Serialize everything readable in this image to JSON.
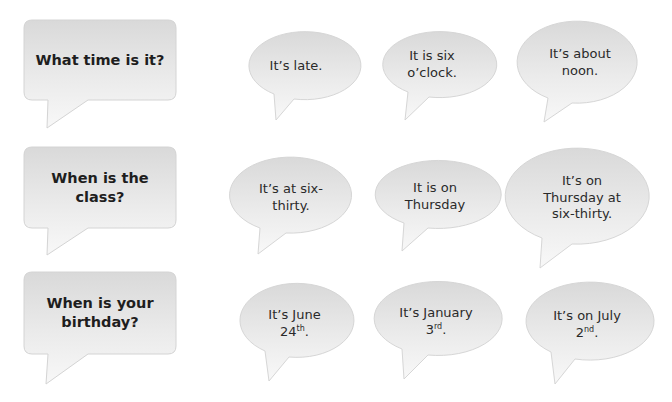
{
  "colors": {
    "bubble_fill_top": "#dcdcdc",
    "bubble_fill_bottom": "#f7f7f7",
    "bubble_stroke": "#d6d6d6",
    "text": "#262626"
  },
  "rows": [
    {
      "question": "What time is it?",
      "answers": [
        {
          "line1": "It’s late.",
          "line2": "",
          "line3": ""
        },
        {
          "line1": "It is six",
          "line2": "o’clock.",
          "line3": ""
        },
        {
          "line1": "It’s about",
          "line2": "noon.",
          "line3": ""
        }
      ]
    },
    {
      "question_line1": "When is the",
      "question_line2": "class?",
      "answers": [
        {
          "line1": "It’s at six-",
          "line2": "thirty.",
          "line3": ""
        },
        {
          "line1": "It is on",
          "line2": "Thursday",
          "line3": ""
        },
        {
          "line1": "It’s on",
          "line2": "Thursday at",
          "line3": "six-thirty."
        }
      ]
    },
    {
      "question_line1": "When is your",
      "question_line2": "birthday?",
      "answers": [
        {
          "line1": "It’s June",
          "num": "24",
          "sup": "th",
          "end": "."
        },
        {
          "line1": "It’s January",
          "num": "3",
          "sup": "rd",
          "end": "."
        },
        {
          "line1": "It’s on July",
          "num": "2",
          "sup": "nd",
          "end": "."
        }
      ]
    }
  ]
}
